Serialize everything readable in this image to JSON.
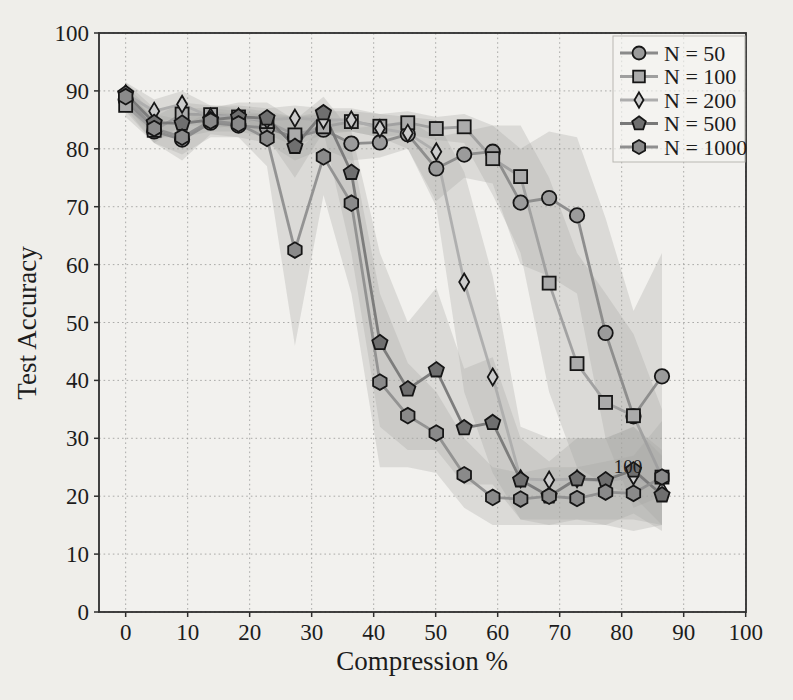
{
  "figure": {
    "background": "#efeeea",
    "plot_background": "#f2f1ee",
    "stray_annotation": "100",
    "stray_annotation_pos": {
      "x": 81.0,
      "y": 23.2
    }
  },
  "chart_data": {
    "type": "line",
    "title": "",
    "xlabel": "Compression %",
    "ylabel": "Test Accuracy",
    "xlim": [
      -4.3,
      100.05
    ],
    "ylim": [
      0,
      100
    ],
    "x_ticks": [
      0,
      10,
      20,
      30,
      40,
      50,
      60,
      70,
      80,
      90,
      100
    ],
    "y_ticks": [
      0,
      10,
      20,
      30,
      40,
      50,
      60,
      70,
      80,
      90,
      100
    ],
    "grid": "dotted",
    "legend_position": "upper right",
    "x": [
      0,
      4.6,
      9.1,
      13.7,
      18.2,
      22.8,
      27.3,
      31.9,
      36.4,
      41.0,
      45.5,
      50.1,
      54.6,
      59.2,
      63.7,
      68.3,
      72.8,
      77.4,
      81.9,
      86.5
    ],
    "series": [
      {
        "name": "N = 50",
        "marker": "circle",
        "line_color": "#8a8a8a",
        "marker_fill": "#9b9b9b",
        "values": [
          88.5,
          83.0,
          81.6,
          84.5,
          84.0,
          83.6,
          82.0,
          83.3,
          80.9,
          81.1,
          82.5,
          76.6,
          79.0,
          79.5,
          70.7,
          71.5,
          68.5,
          48.2,
          33.8,
          40.7
        ],
        "band_lo": [
          86.5,
          81,
          79,
          82,
          82,
          81,
          78,
          80,
          78,
          78.5,
          80,
          71,
          75,
          74,
          60,
          58,
          55,
          30,
          18,
          20
        ],
        "band_hi": [
          90.5,
          85,
          84,
          86.5,
          86,
          86,
          85.5,
          86,
          83.5,
          84,
          85,
          82,
          83,
          84,
          80,
          83,
          82,
          68,
          52,
          62
        ]
      },
      {
        "name": "N = 100",
        "marker": "square",
        "line_color": "#9f9f9f",
        "marker_fill": "#ababab",
        "values": [
          87.5,
          83.2,
          86.0,
          85.9,
          85.5,
          84.7,
          82.4,
          83.8,
          84.7,
          83.9,
          84.5,
          83.5,
          83.8,
          78.3,
          75.2,
          56.8,
          42.9,
          36.2,
          33.9,
          23.3
        ],
        "band_lo": [
          85.5,
          81,
          84,
          84,
          83.5,
          82.5,
          80.5,
          82.5,
          83,
          82,
          82.5,
          81.5,
          81,
          72,
          62,
          38,
          25,
          22,
          20,
          15
        ],
        "band_hi": [
          89.5,
          85.5,
          88,
          87.5,
          87,
          86.5,
          85.5,
          86.5,
          86.5,
          86,
          86.5,
          85.5,
          86,
          84,
          84,
          75,
          62,
          55,
          48,
          35
        ]
      },
      {
        "name": "N = 200",
        "marker": "diamond",
        "line_color": "#adadad",
        "marker_fill": "#cccccc",
        "values": [
          89.5,
          86.5,
          87.7,
          85.5,
          85.5,
          85.0,
          85.3,
          85.0,
          85.0,
          83.5,
          82.7,
          79.5,
          57.0,
          40.6,
          23.0,
          22.8,
          23.0,
          22.5,
          23.5,
          21.0
        ],
        "band_lo": [
          87.5,
          84.5,
          85.5,
          83.5,
          84,
          83,
          83,
          83,
          83,
          82,
          80,
          70,
          38,
          24,
          16,
          16,
          16,
          16,
          16,
          15
        ],
        "band_hi": [
          91.5,
          88.5,
          90,
          87.5,
          87.5,
          87,
          87.5,
          87,
          87,
          86,
          85.5,
          85,
          76,
          58,
          32,
          30,
          30,
          30,
          32,
          28
        ]
      },
      {
        "name": "N = 500",
        "marker": "pentagon",
        "line_color": "#787878",
        "marker_fill": "#6f6f6f",
        "values": [
          89.5,
          84.5,
          84.4,
          85.0,
          85.5,
          85.3,
          80.4,
          86.2,
          75.9,
          46.5,
          38.5,
          41.8,
          31.8,
          32.7,
          22.8,
          20.0,
          23.0,
          22.8,
          24.5,
          20.2
        ],
        "band_lo": [
          87.5,
          82,
          82,
          83,
          83,
          82,
          75,
          83,
          62,
          32,
          28,
          28,
          22,
          22,
          16,
          15,
          16,
          15,
          17,
          14
        ],
        "band_hi": [
          91.5,
          87,
          87,
          87,
          88,
          88,
          85,
          89,
          83,
          62,
          50,
          56,
          42,
          44,
          30,
          26,
          30,
          30,
          32,
          27
        ]
      },
      {
        "name": "N = 1000",
        "marker": "hexagon",
        "line_color": "#8f8f8f",
        "marker_fill": "#8a8a8a",
        "values": [
          89.0,
          83.5,
          82.0,
          84.8,
          84.3,
          81.8,
          62.5,
          78.6,
          70.6,
          39.7,
          33.9,
          30.9,
          23.7,
          19.8,
          19.5,
          20.0,
          19.6,
          20.7,
          20.5,
          23.3
        ],
        "band_lo": [
          87,
          81,
          78,
          82.5,
          82,
          77,
          46,
          72,
          55,
          25,
          25,
          24,
          18,
          15,
          15,
          15,
          15,
          15,
          14,
          15
        ],
        "band_hi": [
          91,
          86,
          85,
          87,
          86.5,
          86,
          79,
          84,
          80,
          55,
          43,
          38,
          30,
          25,
          24,
          25,
          25,
          26,
          27,
          33
        ]
      }
    ]
  },
  "style": {
    "band_fill": "#a5a5a2",
    "band_opacity": 0.3,
    "grid_color": "#9a9a98",
    "frame_color": "#2e2e2e",
    "marker_edge": "#161616",
    "legend_bg": "rgba(245,244,241,0.65)",
    "legend_border": "#b9b8b2"
  }
}
